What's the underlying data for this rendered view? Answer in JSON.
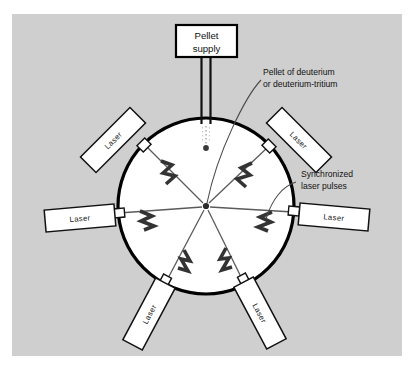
{
  "figure": {
    "panel_color": "#cfcfcf",
    "page_color": "#ffffff",
    "ink_color": "#111111",
    "chamber_fill": "#ffffff",
    "chamber_stroke": "#000000"
  },
  "pellet_supply": {
    "line1": "Pellet",
    "line2": "supply"
  },
  "callouts": [
    {
      "id": "pellet-callout",
      "line1": "Pellet of deuterium",
      "line2": "or deuterium-tritium"
    },
    {
      "id": "pulses-callout",
      "line1": "Synchronized",
      "line2": "laser pulses"
    }
  ],
  "lasers": [
    {
      "id": "laser-upper-left",
      "label": "Laser",
      "angle_deg": 215
    },
    {
      "id": "laser-upper-right",
      "label": "Laser",
      "angle_deg": 325
    },
    {
      "id": "laser-left",
      "label": "Laser",
      "angle_deg": 175
    },
    {
      "id": "laser-right",
      "label": "Laser",
      "angle_deg": 5
    },
    {
      "id": "laser-lower-left",
      "label": "Laser",
      "angle_deg": 108
    },
    {
      "id": "laser-lower-right",
      "label": "Laser",
      "angle_deg": 72
    }
  ],
  "chamber": {
    "center_x": 206,
    "center_y": 206,
    "radius": 88
  },
  "pellet": {
    "x": 206,
    "y": 148
  }
}
